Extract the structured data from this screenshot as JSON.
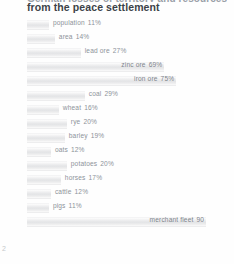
{
  "page": {
    "page_number": "2",
    "title_clipped": "German losses of territory and resources",
    "title": "from the peace settlement"
  },
  "chart_data": {
    "type": "bar",
    "orientation": "horizontal",
    "title": "from the peace settlement",
    "xlabel": "",
    "ylabel": "",
    "xlim": [
      0,
      100
    ],
    "grid": false,
    "legend": null,
    "value_suffix": "%",
    "categories": [
      "population",
      "area",
      "lead ore",
      "zinc ore",
      "iron ore",
      "coal",
      "wheat",
      "rye",
      "barley",
      "oats",
      "potatoes",
      "horses",
      "cattle",
      "pigs",
      "merchant fleet"
    ],
    "values": [
      11,
      14,
      27,
      69,
      75,
      29,
      16,
      20,
      19,
      12,
      20,
      17,
      12,
      11,
      90
    ],
    "bars": [
      {
        "label": "population",
        "value": 11,
        "value_text": "11%",
        "label_on_bar": false
      },
      {
        "label": "area",
        "value": 14,
        "value_text": "14%",
        "label_on_bar": false
      },
      {
        "label": "lead ore",
        "value": 27,
        "value_text": "27%",
        "label_on_bar": false
      },
      {
        "label": "zinc ore",
        "value": 69,
        "value_text": "69%",
        "label_on_bar": true
      },
      {
        "label": "iron ore",
        "value": 75,
        "value_text": "75%",
        "label_on_bar": true
      },
      {
        "label": "coal",
        "value": 29,
        "value_text": "29%",
        "label_on_bar": false
      },
      {
        "label": "wheat",
        "value": 16,
        "value_text": "16%",
        "label_on_bar": false
      },
      {
        "label": "rye",
        "value": 20,
        "value_text": "20%",
        "label_on_bar": false
      },
      {
        "label": "barley",
        "value": 19,
        "value_text": "19%",
        "label_on_bar": false
      },
      {
        "label": "oats",
        "value": 12,
        "value_text": "12%",
        "label_on_bar": false
      },
      {
        "label": "potatoes",
        "value": 20,
        "value_text": "20%",
        "label_on_bar": false
      },
      {
        "label": "horses",
        "value": 17,
        "value_text": "17%",
        "label_on_bar": false
      },
      {
        "label": "cattle",
        "value": 12,
        "value_text": "12%",
        "label_on_bar": false
      },
      {
        "label": "pigs",
        "value": 11,
        "value_text": "11%",
        "label_on_bar": false
      },
      {
        "label": "merchant fleet",
        "value": 90,
        "value_text": "90",
        "label_on_bar": true
      }
    ]
  },
  "style": {
    "bar_fill": "#e6e7e9",
    "text_color": "#8d939a",
    "title_color": "#3c4248",
    "background": "#fefefe"
  }
}
